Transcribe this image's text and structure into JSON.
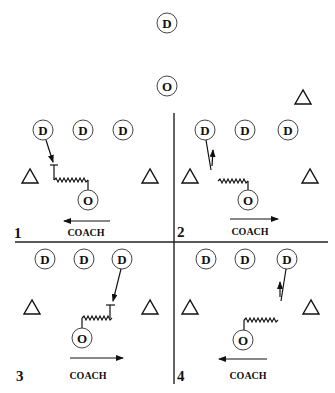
{
  "diagram": {
    "type": "basketball-drill",
    "top": {
      "defender": {
        "label": "D",
        "x": 167,
        "y": 23
      },
      "offense": {
        "label": "O",
        "x": 167,
        "y": 86
      },
      "cone": {
        "x": 303,
        "y": 97
      }
    },
    "dividers": {
      "vertical": {
        "x": 174,
        "y1": 113,
        "y2": 384
      },
      "horizontal": {
        "y": 242,
        "x1": 15,
        "x2": 328
      }
    },
    "quadrants": [
      {
        "number": "1",
        "coach_label": "COACH",
        "coach_arrow": "left",
        "defenders": [
          "D",
          "D",
          "D"
        ],
        "offense": "O",
        "action": "defender slides to take charge"
      },
      {
        "number": "2",
        "coach_label": "COACH",
        "coach_arrow": "right",
        "defenders": [
          "D",
          "D",
          "D"
        ],
        "offense": "O",
        "action": "defender closes out and recovers"
      },
      {
        "number": "3",
        "coach_label": "COACH",
        "coach_arrow": "right",
        "defenders": [
          "D",
          "D",
          "D"
        ],
        "offense": "O",
        "action": "defender slides to take charge"
      },
      {
        "number": "4",
        "coach_label": "COACH",
        "coach_arrow": "left",
        "defenders": [
          "D",
          "D",
          "D"
        ],
        "offense": "O",
        "action": "defender closes out and recovers"
      }
    ],
    "colors": {
      "ink": "#111111",
      "circle_stroke": "#444444",
      "background": "#ffffff"
    }
  }
}
